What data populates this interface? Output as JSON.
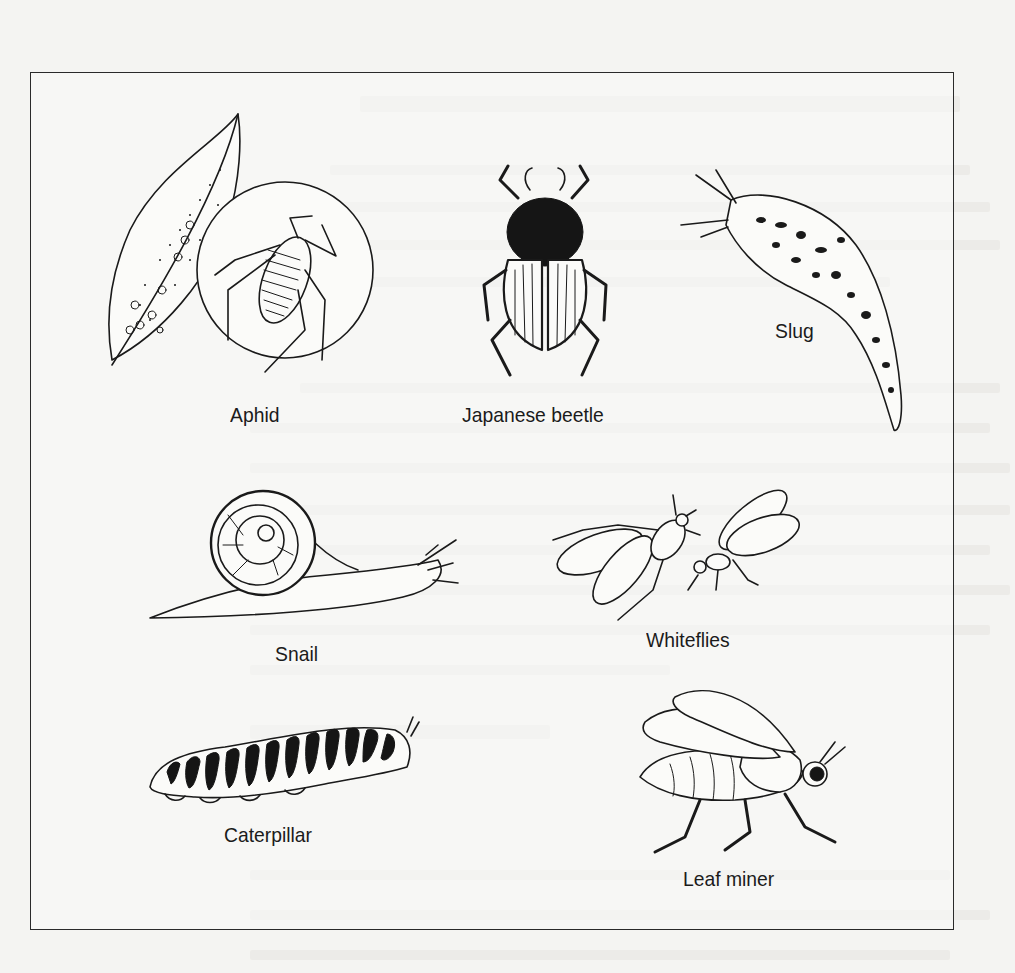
{
  "figure": {
    "items": [
      {
        "id": "aphid",
        "label": "Aphid"
      },
      {
        "id": "japanese-beetle",
        "label": "Japanese beetle"
      },
      {
        "id": "slug",
        "label": "Slug"
      },
      {
        "id": "snail",
        "label": "Snail"
      },
      {
        "id": "whiteflies",
        "label": "Whiteflies"
      },
      {
        "id": "caterpillar",
        "label": "Caterpillar"
      },
      {
        "id": "leaf-miner",
        "label": "Leaf miner"
      }
    ]
  },
  "colors": {
    "page": "#f4f4f2",
    "ink": "#1a1a1a",
    "frame": "#2a2a2a"
  }
}
